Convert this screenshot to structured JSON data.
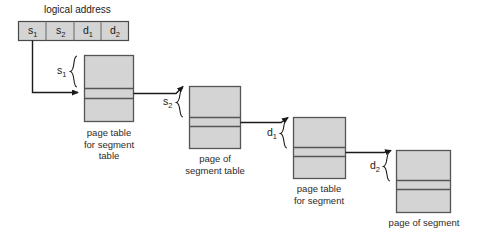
{
  "diagram": {
    "title": "logical address",
    "background_color": "#ffffff",
    "block_fill": "#d4d4d4",
    "block_stroke": "#555555",
    "line_color": "#1a1a1a",
    "address": {
      "label": "logical address",
      "cells": [
        {
          "name": "s",
          "subscript": "1"
        },
        {
          "name": "s",
          "subscript": "2"
        },
        {
          "name": "d",
          "subscript": "1"
        },
        {
          "name": "d",
          "subscript": "2"
        }
      ]
    },
    "blocks": [
      {
        "id": "page-table-for-segment-table",
        "caption_lines": [
          "page table",
          "for segment",
          "table"
        ],
        "brace_label": {
          "name": "s",
          "subscript": "1"
        },
        "rows": 3
      },
      {
        "id": "page-of-segment-table",
        "caption_lines": [
          "page of",
          "segment table"
        ],
        "brace_label": {
          "name": "s",
          "subscript": "2"
        },
        "rows": 3
      },
      {
        "id": "page-table-for-segment",
        "caption_lines": [
          "page table",
          "for segment"
        ],
        "brace_label": {
          "name": "d",
          "subscript": "1"
        },
        "rows": 3
      },
      {
        "id": "page-of-segment",
        "caption_lines": [
          "page of segment"
        ],
        "brace_label": {
          "name": "d",
          "subscript": "2"
        },
        "rows": 3
      }
    ]
  }
}
